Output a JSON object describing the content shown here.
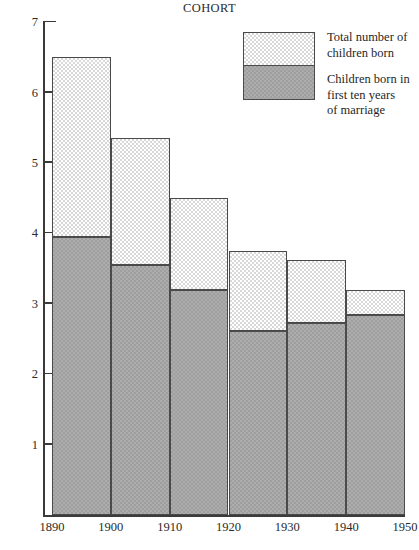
{
  "chart_data": {
    "type": "bar",
    "title": "COHORT",
    "xlabel": "",
    "ylabel": "",
    "stacked": true,
    "grid": false,
    "legend_position": "top-right",
    "ylim": [
      0,
      7
    ],
    "yticks": [
      1,
      2,
      3,
      4,
      5,
      6,
      7
    ],
    "ytick_labels": [
      "1",
      "2",
      "3",
      "4",
      "5",
      "6",
      "7"
    ],
    "x_boundaries": [
      1890,
      1900,
      1910,
      1920,
      1930,
      1940,
      1950
    ],
    "xtick_labels": [
      "1890",
      "1900",
      "1910",
      "1920",
      "1930",
      "1940",
      "1950"
    ],
    "categories": [
      "1890-1900",
      "1900-1910",
      "1910-1920",
      "1920-1930",
      "1930-1940",
      "1940-1950"
    ],
    "series": [
      {
        "name": "Total number of children born",
        "values": [
          6.5,
          5.35,
          4.5,
          3.75,
          3.63,
          3.2
        ]
      },
      {
        "name": "Children born in first ten years of marriage",
        "values": [
          3.95,
          3.55,
          3.2,
          2.62,
          2.73,
          2.85
        ]
      }
    ],
    "colors": {
      "total": "#d8d8d8",
      "first_ten_years": "#9e9e9e",
      "outline": "#4a4a4a",
      "axis": "#3a3a3a",
      "text": "#1a1a1a"
    }
  },
  "legend": {
    "entries": [
      {
        "label": "Total number of\nchildren born",
        "line1": "Total number of",
        "line2": "children born"
      },
      {
        "label": "Children born in first ten years of marriage",
        "line1": "Children born in",
        "line2": "first ten years",
        "line3": "of marriage"
      }
    ]
  }
}
